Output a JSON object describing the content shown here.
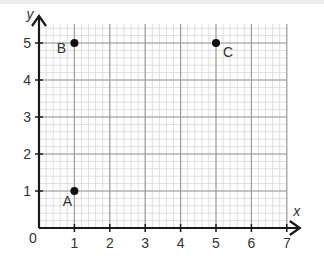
{
  "chart_data": {
    "type": "scatter",
    "title": "",
    "xlabel": "x",
    "ylabel": "y",
    "xlim": [
      0,
      7
    ],
    "ylim": [
      0,
      5
    ],
    "grid": true,
    "minor_grid_per_unit": 5,
    "x_ticks": [
      "1",
      "2",
      "3",
      "4",
      "5",
      "6",
      "7"
    ],
    "y_ticks": [
      "1",
      "2",
      "3",
      "4",
      "5"
    ],
    "origin_label": "0",
    "points": [
      {
        "label": "A",
        "x": 1,
        "y": 1
      },
      {
        "label": "B",
        "x": 1,
        "y": 5
      },
      {
        "label": "C",
        "x": 5,
        "y": 5
      }
    ]
  },
  "colors": {
    "axis": "#1a1a1a",
    "major_grid": "#999999",
    "minor_grid": "#d6d6d6",
    "point": "#111111",
    "text": "#333333"
  }
}
